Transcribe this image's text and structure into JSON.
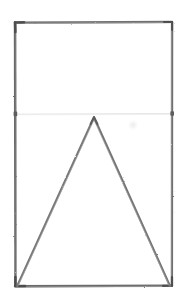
{
  "document": {
    "title": "Rectangle with inscribed triangle",
    "medium": "pencil sketch on white paper",
    "width": 189,
    "height": 304,
    "background_color": "#ffffff"
  },
  "palette": {
    "paper": "#ffffff",
    "stroke_dark": "#6b6b6b",
    "stroke_corner": "#4a4a4a",
    "stroke_medium": "#7d7d7d",
    "stroke_faint": "#e2e2e2",
    "smudge": "#ededed"
  },
  "figures": {
    "rectangle": {
      "label": "rectangle-outline",
      "corners": {
        "top_left": [
          15,
          22
        ],
        "top_right": [
          172,
          22
        ],
        "bottom_right": [
          172,
          286
        ],
        "bottom_left": [
          15,
          286
        ]
      },
      "stroke_color": "#6b6b6b",
      "stroke_width": 2.2
    },
    "guide_line": {
      "label": "horizontal-guide-line",
      "start": [
        15,
        114
      ],
      "end": [
        172,
        114
      ],
      "stroke_color": "#e2e2e2",
      "stroke_width": 1
    },
    "triangle": {
      "label": "inscribed-triangle",
      "vertices": {
        "apex": [
          94,
          117
        ],
        "base_left": [
          17,
          286
        ],
        "base_right": [
          170,
          286
        ]
      },
      "stroke_color": "#7d7d7d",
      "stroke_width": 2.0
    },
    "smudge": {
      "label": "stray-pencil-smudge",
      "center": [
        133,
        125
      ],
      "radius": 3,
      "color": "#ededed"
    }
  },
  "chart_data": {
    "type": "scatter",
    "title": "Rectangle with inscribed triangle",
    "xlabel": "",
    "ylabel": "",
    "xlim": [
      0,
      189
    ],
    "ylim": [
      0,
      304
    ],
    "grid": false,
    "legend": "none",
    "series": [
      {
        "name": "rectangle-outline",
        "x": [
          15,
          172,
          172,
          15,
          15
        ],
        "y": [
          22,
          22,
          286,
          286,
          22
        ]
      },
      {
        "name": "inscribed-triangle",
        "x": [
          17,
          94,
          170,
          17
        ],
        "y": [
          286,
          117,
          286,
          286
        ]
      },
      {
        "name": "horizontal-guide-line",
        "x": [
          15,
          172
        ],
        "y": [
          114,
          114
        ]
      }
    ]
  }
}
